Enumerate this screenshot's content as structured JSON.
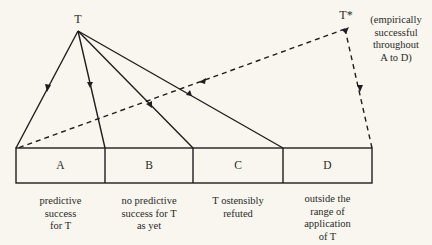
{
  "nodes": {
    "theory": {
      "label": "T"
    },
    "successor": {
      "label": "T*",
      "note_lines": [
        "(empirically",
        "successful",
        "throughout",
        "A to D)"
      ]
    }
  },
  "domains": [
    {
      "letter": "A",
      "caption_lines": [
        "predictive",
        "success",
        "for T"
      ]
    },
    {
      "letter": "B",
      "caption_lines": [
        "no predictive",
        "success for T",
        "as yet"
      ]
    },
    {
      "letter": "C",
      "caption_lines": [
        "T ostensibly",
        "refuted"
      ]
    },
    {
      "letter": "D",
      "caption_lines": [
        "outside the",
        "range of",
        "application",
        "of T"
      ]
    }
  ],
  "colors": {
    "line": "#1e1e1e",
    "background": "#f8f6ee"
  }
}
